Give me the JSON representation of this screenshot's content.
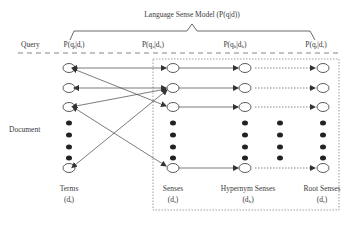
{
  "title": "Language Sense Model (P(q|d))",
  "row_labels": {
    "query": "Query",
    "document": "Document"
  },
  "probabilities": [
    {
      "id": "terms",
      "text": "P(q",
      "sub1": "t",
      "mid": "|d",
      "sub2": "t",
      "end": ")"
    },
    {
      "id": "senses",
      "text": "P(q",
      "sub1": "s",
      "mid": "|d",
      "sub2": "s",
      "end": ")"
    },
    {
      "id": "hypernym",
      "text": "P(q",
      "sub1": "h",
      "mid": "|d",
      "sub2": "h",
      "end": ")"
    },
    {
      "id": "root",
      "text": "P(q",
      "sub1": "r",
      "mid": "|d",
      "sub2": "r",
      "end": ")"
    }
  ],
  "columns": [
    {
      "id": "terms",
      "label": "Terms",
      "var": "(d",
      "sub": "t",
      "end": ")"
    },
    {
      "id": "senses",
      "label": "Senses",
      "var": "(d",
      "sub": "s",
      "end": ")"
    },
    {
      "id": "hypernym",
      "label": "Hypernym Senses",
      "var": "(d",
      "sub": "h",
      "end": ")"
    },
    {
      "id": "root",
      "label": "Root Senses",
      "var": "(d",
      "sub": "r",
      "end": ")"
    }
  ],
  "colors": {
    "line": "#555555",
    "text": "#3a3a3a"
  }
}
